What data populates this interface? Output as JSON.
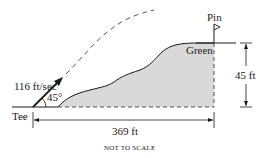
{
  "diagram": {
    "labels": {
      "velocity": "116 ft/sec",
      "angle": "45°",
      "tee": "Tee",
      "pin": "Pin",
      "green": "Green",
      "height": "45 ft",
      "distance": "369 ft",
      "note": "NOT TO SCALE"
    },
    "values": {
      "initial_speed_ft_per_sec": 116,
      "launch_angle_deg": 45,
      "horizontal_distance_ft": 369,
      "green_elevation_ft": 45
    },
    "colors": {
      "line": "#1a1a1a",
      "hill_fill": "#d9d9d9",
      "trajectory_dash": "#555555",
      "background": "#ffffff"
    }
  }
}
